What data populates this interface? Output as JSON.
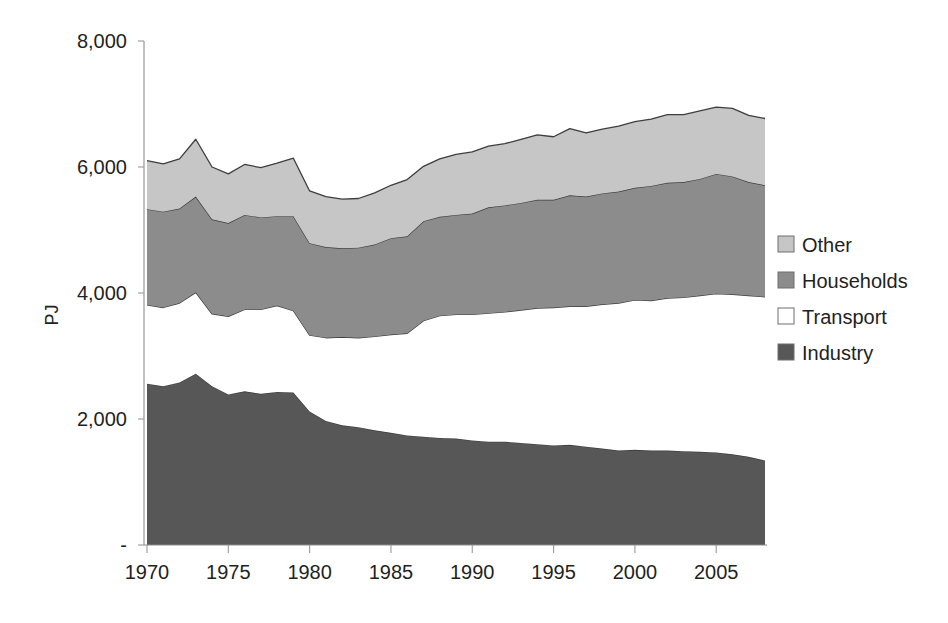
{
  "chart_data": {
    "type": "area",
    "stacked": true,
    "title": "",
    "subtitle": "",
    "xlabel": "",
    "ylabel": "PJ",
    "grid": false,
    "legend_position": "right",
    "xlim": [
      1970,
      2008
    ],
    "ylim": [
      0,
      8000
    ],
    "y_ticks": [
      0,
      2000,
      4000,
      6000,
      8000
    ],
    "y_tick_labels": [
      "-",
      "2,000",
      "4,000",
      "6,000",
      "8,000"
    ],
    "x_ticks": [
      1970,
      1975,
      1980,
      1985,
      1990,
      1995,
      2000,
      2005
    ],
    "x_tick_labels": [
      "1970",
      "1975",
      "1980",
      "1985",
      "1990",
      "1995",
      "2000",
      "2005"
    ],
    "x": [
      1970,
      1971,
      1972,
      1973,
      1974,
      1975,
      1976,
      1977,
      1978,
      1979,
      1980,
      1981,
      1982,
      1983,
      1984,
      1985,
      1986,
      1987,
      1988,
      1989,
      1990,
      1991,
      1992,
      1993,
      1994,
      1995,
      1996,
      1997,
      1998,
      1999,
      2000,
      2001,
      2002,
      2003,
      2004,
      2005,
      2006,
      2007,
      2008
    ],
    "series": [
      {
        "name": "Industry",
        "color": "#575757",
        "order": 1,
        "values": [
          2560,
          2520,
          2580,
          2720,
          2520,
          2390,
          2440,
          2400,
          2430,
          2420,
          2120,
          1970,
          1900,
          1870,
          1820,
          1780,
          1740,
          1720,
          1700,
          1690,
          1660,
          1640,
          1640,
          1620,
          1600,
          1580,
          1590,
          1560,
          1530,
          1500,
          1510,
          1500,
          1500,
          1490,
          1480,
          1470,
          1440,
          1400,
          1340
        ]
      },
      {
        "name": "Transport",
        "color": "#ffffff",
        "order": 2,
        "values": [
          1250,
          1250,
          1260,
          1290,
          1150,
          1240,
          1300,
          1340,
          1370,
          1300,
          1210,
          1320,
          1400,
          1420,
          1490,
          1560,
          1620,
          1840,
          1940,
          1970,
          2000,
          2040,
          2060,
          2110,
          2160,
          2190,
          2200,
          2230,
          2290,
          2340,
          2380,
          2380,
          2420,
          2440,
          2480,
          2520,
          2540,
          2560,
          2600
        ]
      },
      {
        "name": "Households",
        "color": "#8c8c8c",
        "order": 3,
        "values": [
          1520,
          1520,
          1500,
          1520,
          1500,
          1480,
          1500,
          1460,
          1420,
          1500,
          1460,
          1440,
          1410,
          1430,
          1460,
          1530,
          1540,
          1580,
          1570,
          1580,
          1600,
          1680,
          1690,
          1700,
          1720,
          1710,
          1760,
          1740,
          1760,
          1770,
          1780,
          1820,
          1830,
          1830,
          1850,
          1900,
          1870,
          1800,
          1770
        ]
      },
      {
        "name": "Other",
        "color": "#c6c6c6",
        "order": 4,
        "values": [
          770,
          760,
          790,
          910,
          830,
          780,
          800,
          790,
          840,
          920,
          830,
          800,
          780,
          780,
          820,
          840,
          900,
          870,
          920,
          960,
          980,
          970,
          980,
          1010,
          1030,
          1000,
          1060,
          1010,
          1020,
          1040,
          1050,
          1060,
          1080,
          1070,
          1080,
          1060,
          1080,
          1060,
          1060
        ]
      }
    ],
    "legend": [
      {
        "label": "Other",
        "color": "#c6c6c6"
      },
      {
        "label": "Households",
        "color": "#8c8c8c"
      },
      {
        "label": "Transport",
        "color": "#ffffff"
      },
      {
        "label": "Industry",
        "color": "#575757"
      }
    ]
  }
}
